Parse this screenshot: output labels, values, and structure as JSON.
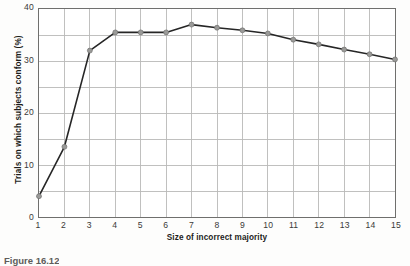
{
  "figure": {
    "caption": "Figure 16.12"
  },
  "chart_data": {
    "type": "line",
    "title": "",
    "xlabel": "Size of incorrect majority",
    "ylabel": "Trials on which subjects conform (%)",
    "x": [
      1,
      2,
      3,
      4,
      5,
      6,
      7,
      8,
      9,
      10,
      11,
      12,
      13,
      14,
      15
    ],
    "values": [
      4,
      13.5,
      32,
      35.5,
      35.5,
      35.5,
      37,
      36.4,
      35.9,
      35.3,
      34.1,
      33.2,
      32.2,
      31.3,
      30.3
    ],
    "series": [
      {
        "name": "Conformity rate",
        "values": [
          4,
          13.5,
          32,
          35.5,
          35.5,
          35.5,
          37,
          36.4,
          35.9,
          35.3,
          34.1,
          33.2,
          32.2,
          31.3,
          30.3
        ]
      }
    ],
    "xlim": [
      1,
      15
    ],
    "ylim": [
      0,
      40
    ],
    "xticks": [
      1,
      2,
      3,
      4,
      5,
      6,
      7,
      8,
      9,
      10,
      11,
      12,
      13,
      14,
      15
    ],
    "xticklabels": [
      "1",
      "2",
      "3",
      "4",
      "5",
      "6",
      "7",
      "8",
      "9",
      "10",
      "11",
      "12",
      "13",
      "14",
      "15"
    ],
    "yticks": [
      0,
      10,
      20,
      30,
      40
    ],
    "yticklabels": [
      "0",
      "10",
      "20",
      "30",
      "40"
    ],
    "y_minor_ticks": [
      5,
      15,
      25,
      35
    ],
    "grid": true,
    "grid_color": "#b9b9b7",
    "legend": false,
    "legend_position": "none",
    "markers": {
      "shape": "circle",
      "visible": true,
      "face_color": "#9a9a98",
      "edge_color": "#6e6e6c"
    },
    "line_color": "#262626",
    "line_width": 1.6,
    "marker_labels": [
      "4",
      "13.5",
      "32",
      "35.5",
      "35.5",
      "35.5",
      "37",
      "36.4",
      "35.9",
      "35.3",
      "34.1",
      "33.2",
      "32.2",
      "31.3",
      "30.3"
    ]
  }
}
